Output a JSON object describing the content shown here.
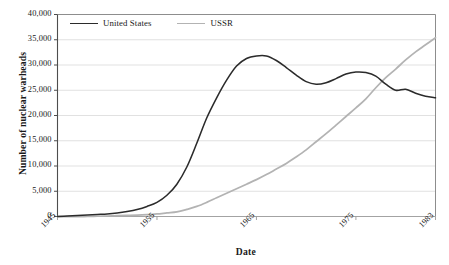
{
  "chart_data": {
    "type": "line",
    "title": "",
    "xlabel": "Date",
    "ylabel": "Number of nuclear warheads",
    "xlim": [
      1945,
      1983
    ],
    "ylim": [
      0,
      40000
    ],
    "grid": true,
    "legend_position": "top-left-inside",
    "x_ticks": [
      "1945",
      "1955",
      "1965",
      "1975",
      "1983"
    ],
    "x_tick_values": [
      1945,
      1955,
      1965,
      1975,
      1983
    ],
    "y_ticks": [
      "0",
      "5,000",
      "10,000",
      "15,000",
      "20,000",
      "25,000",
      "30,000",
      "35,000",
      "40,000"
    ],
    "y_tick_values": [
      0,
      5000,
      10000,
      15000,
      20000,
      25000,
      30000,
      35000,
      40000
    ],
    "x": [
      1945,
      1946,
      1947,
      1948,
      1949,
      1950,
      1951,
      1952,
      1953,
      1954,
      1955,
      1956,
      1957,
      1958,
      1959,
      1960,
      1961,
      1962,
      1963,
      1964,
      1965,
      1966,
      1967,
      1968,
      1969,
      1970,
      1971,
      1972,
      1973,
      1974,
      1975,
      1976,
      1977,
      1978,
      1979,
      1980,
      1981,
      1982,
      1983
    ],
    "series": [
      {
        "name": "United States",
        "color": "#2b2b2b",
        "values": [
          0,
          100,
          200,
          300,
          400,
          500,
          700,
          1000,
          1400,
          2000,
          2800,
          4200,
          6400,
          9800,
          14500,
          19500,
          23500,
          27000,
          29800,
          31300,
          31800,
          31800,
          30900,
          29500,
          28000,
          26700,
          26200,
          26500,
          27300,
          28200,
          28600,
          28500,
          27800,
          26200,
          25000,
          25200,
          24400,
          23800,
          23500
        ]
      },
      {
        "name": "USSR",
        "color": "#b3b3b3",
        "values": [
          0,
          0,
          0,
          0,
          50,
          100,
          150,
          200,
          250,
          350,
          500,
          700,
          900,
          1400,
          2000,
          2800,
          3700,
          4600,
          5500,
          6400,
          7300,
          8300,
          9400,
          10500,
          11800,
          13200,
          14800,
          16400,
          18100,
          19800,
          21500,
          23300,
          25500,
          27500,
          29200,
          31000,
          32600,
          34000,
          35400
        ]
      }
    ]
  }
}
